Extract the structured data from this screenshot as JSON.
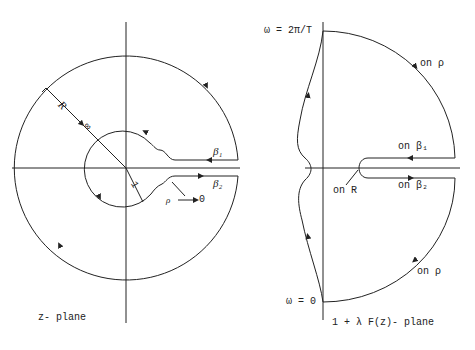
{
  "left_diagram": {
    "plane_label": "z- plane",
    "radius_label": "R",
    "infinity_label": "∞",
    "unit_radius_label": "1",
    "beta1_label": "β₁",
    "beta2_label": "β₂",
    "rho_label": "ρ",
    "rho_arrow_label": "→ 0"
  },
  "right_diagram": {
    "plane_label": "1 + λ F(z)- plane",
    "omega_top_label": "ω = 2π/T",
    "omega_bottom_label": "ω = 0",
    "on_rho_top": "on ρ",
    "on_rho_bottom": "on ρ",
    "on_beta1": "on β₁",
    "on_beta2": "on β₂",
    "on_R": "on R"
  },
  "colors": {
    "ink": "#222222",
    "background": "#ffffff"
  }
}
